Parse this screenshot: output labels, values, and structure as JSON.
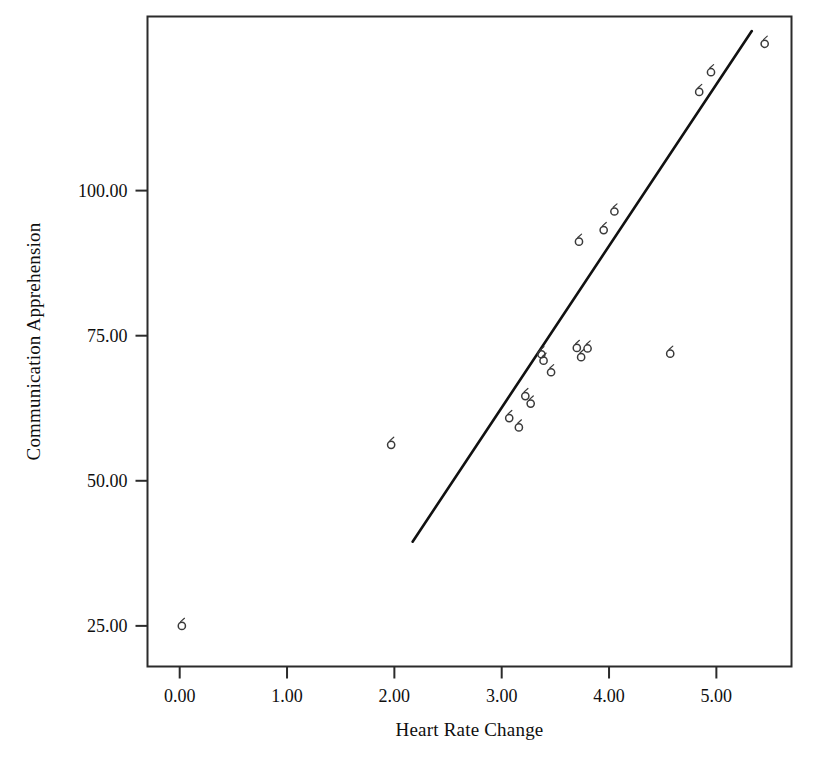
{
  "chart_data": {
    "type": "scatter",
    "title": "",
    "xlabel": "Heart Rate Change",
    "ylabel": "Communication Apprehension",
    "xlim": [
      -0.3,
      5.7
    ],
    "ylim": [
      18.0,
      130.0
    ],
    "xticks": [
      "0.00",
      "1.00",
      "2.00",
      "3.00",
      "4.00",
      "5.00"
    ],
    "xtick_values": [
      0.0,
      1.0,
      2.0,
      3.0,
      4.0,
      5.0
    ],
    "yticks": [
      "25.00",
      "50.00",
      "75.00",
      "100.00"
    ],
    "ytick_values": [
      25.0,
      50.0,
      75.0,
      100.0
    ],
    "grid": false,
    "legend": null,
    "marker": "open-circle",
    "marker_color": "#3a3a3a",
    "line_color": "#111111",
    "frame": true,
    "points": [
      {
        "x": 0.02,
        "y": 25.0
      },
      {
        "x": 1.97,
        "y": 56.2
      },
      {
        "x": 3.07,
        "y": 60.8
      },
      {
        "x": 3.16,
        "y": 59.2
      },
      {
        "x": 3.22,
        "y": 64.6
      },
      {
        "x": 3.27,
        "y": 63.3
      },
      {
        "x": 3.37,
        "y": 71.8
      },
      {
        "x": 3.39,
        "y": 70.7
      },
      {
        "x": 3.46,
        "y": 68.7
      },
      {
        "x": 3.7,
        "y": 72.9
      },
      {
        "x": 3.74,
        "y": 71.3
      },
      {
        "x": 3.8,
        "y": 72.8
      },
      {
        "x": 3.72,
        "y": 91.2
      },
      {
        "x": 3.95,
        "y": 93.2
      },
      {
        "x": 4.05,
        "y": 96.4
      },
      {
        "x": 4.57,
        "y": 71.9
      },
      {
        "x": 4.84,
        "y": 117.0
      },
      {
        "x": 4.95,
        "y": 120.4
      },
      {
        "x": 5.45,
        "y": 125.3
      }
    ],
    "fit_line": {
      "type": "linear-regression",
      "x_start": 2.17,
      "y_start": 39.5,
      "x_end": 5.33,
      "y_end": 127.5
    }
  }
}
